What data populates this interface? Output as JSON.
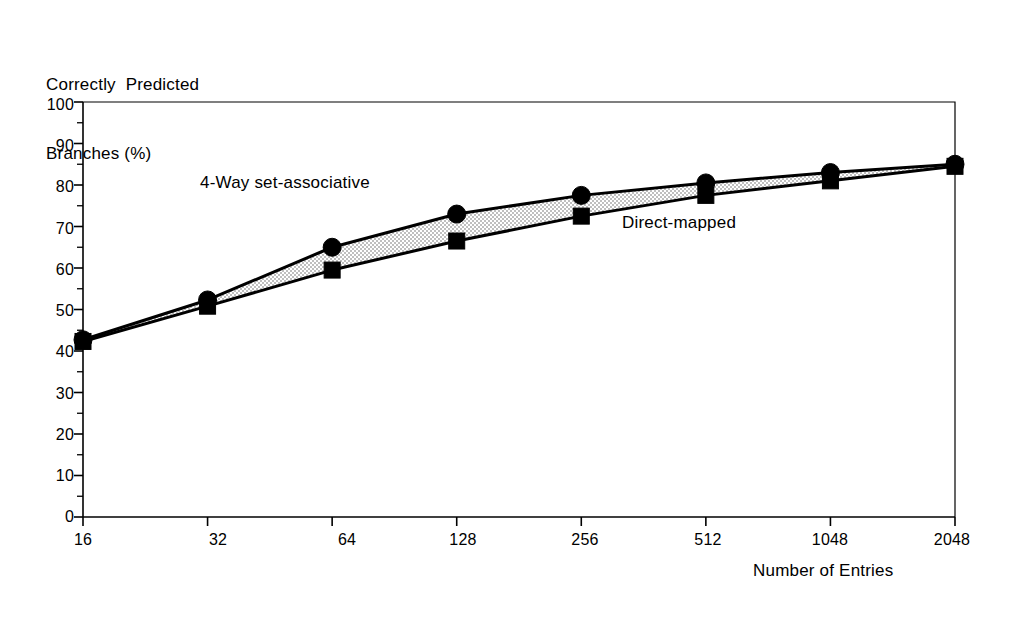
{
  "chart_data": {
    "type": "line",
    "title": "",
    "subtitle": "",
    "ylabel_line1": "Correctly  Predicted",
    "ylabel_line2": "Branches (%)",
    "xlabel": "Number of Entries",
    "categories": [
      "16",
      "32",
      "64",
      "128",
      "256",
      "512",
      "1048",
      "2048"
    ],
    "x_tick_labels": [
      "16",
      "32",
      "64",
      "128",
      "256",
      "512",
      "1048",
      "2048"
    ],
    "y_tick_labels": [
      "0",
      "10",
      "20",
      "30",
      "40",
      "50",
      "60",
      "70",
      "80",
      "90",
      "100"
    ],
    "y_ticks": [
      0,
      10,
      20,
      30,
      40,
      50,
      60,
      70,
      80,
      90,
      100
    ],
    "ylim": [
      0,
      100
    ],
    "y_minor_tick_interval": 5,
    "grid": false,
    "legend_position": "inline-annotations",
    "series": [
      {
        "name": "4-Way set-associative",
        "marker": "circle",
        "color": "#000000",
        "values": [
          42.7,
          52.3,
          65.0,
          73.0,
          77.5,
          80.5,
          83.0,
          85.0
        ]
      },
      {
        "name": "Direct-mapped",
        "marker": "square",
        "color": "#000000",
        "values": [
          42.3,
          50.8,
          59.5,
          66.5,
          72.5,
          77.5,
          81.0,
          84.5
        ]
      }
    ],
    "annotations": [
      {
        "text": "4-Way set-associative",
        "series": "4-Way set-associative"
      },
      {
        "text": "Direct-mapped",
        "series": "Direct-mapped"
      }
    ],
    "band_fill_color": "#d9d9d9",
    "line_color": "#000000",
    "frame_color": "#000000"
  }
}
